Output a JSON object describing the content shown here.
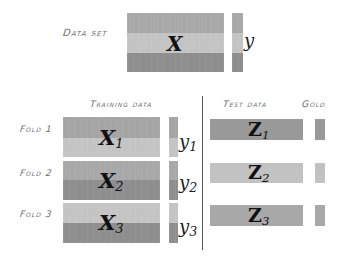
{
  "diagram": {
    "dataset": {
      "label": "Data set",
      "matrix_symbol": "X",
      "target_symbol": "y",
      "bands": [
        "#a8a8a8",
        "#c4c4c4",
        "#8e8e8e"
      ]
    },
    "headers": {
      "training": "Training data",
      "test": "Test data",
      "gold": "Gold"
    },
    "folds": [
      {
        "label": "Fold 1",
        "train_symbol": "X",
        "train_sub": "1",
        "target_symbol": "y",
        "target_sub": "1",
        "train_bands": [
          "#a5a5a5",
          "#c4c4c4"
        ],
        "test_symbol": "Z",
        "test_sub": "1",
        "test_color": "#999999"
      },
      {
        "label": "Fold 2",
        "train_symbol": "X",
        "train_sub": "2",
        "target_symbol": "y",
        "target_sub": "2",
        "train_bands": [
          "#a8a8a8",
          "#8e8e8e"
        ],
        "test_symbol": "Z",
        "test_sub": "2",
        "test_color": "#c2c2c2"
      },
      {
        "label": "Fold 3",
        "train_symbol": "X",
        "train_sub": "3",
        "target_symbol": "y",
        "target_sub": "3",
        "train_bands": [
          "#c4c4c4",
          "#8e8e8e"
        ],
        "test_symbol": "Z",
        "test_sub": "3",
        "test_color": "#a8a8a8"
      }
    ]
  }
}
